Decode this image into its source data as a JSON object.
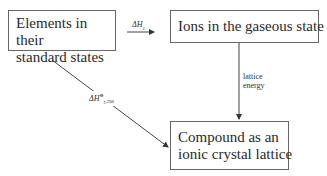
{
  "diagram": {
    "nodes": [
      {
        "id": "elements",
        "lines": [
          "Elements in their",
          "standard states"
        ]
      },
      {
        "id": "ions",
        "lines": [
          "Ions in the gaseous state"
        ]
      },
      {
        "id": "compound",
        "lines": [
          "Compound as an",
          "ionic crystal lattice"
        ]
      }
    ],
    "edges": [
      {
        "from": "elements",
        "to": "ions",
        "label": "ΔH",
        "label_sub": "1"
      },
      {
        "from": "ions",
        "to": "compound",
        "label_lines": [
          "lattice",
          "energy"
        ]
      },
      {
        "from": "elements",
        "to": "compound",
        "label": "ΔH",
        "label_sup": "⊖",
        "label_sub": "f,298"
      }
    ]
  }
}
